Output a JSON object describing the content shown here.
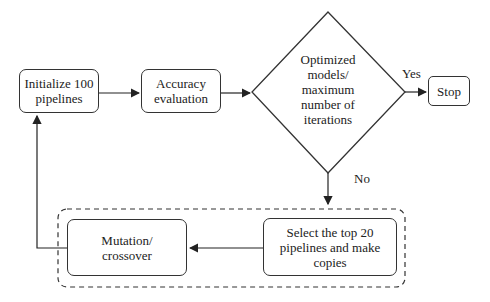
{
  "diagram": {
    "nodes": {
      "init": {
        "label": "Initialize 100 pipelines"
      },
      "accuracy": {
        "label": "Accuracy evaluation"
      },
      "decision": {
        "label": "Optimized models/ maximum number of iterations"
      },
      "stop": {
        "label": "Stop"
      },
      "select": {
        "label": "Select the top 20 pipelines and make copies"
      },
      "mutation": {
        "label": "Mutation/ crossover"
      }
    },
    "edges": {
      "yes_label": "Yes",
      "no_label": "No"
    },
    "colors": {
      "stroke": "#333333",
      "background": "#ffffff"
    }
  }
}
